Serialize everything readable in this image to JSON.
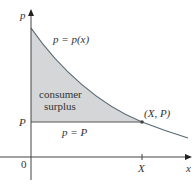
{
  "diagram": {
    "title": "Consumer surplus",
    "axes": {
      "y_label": "p",
      "x_label": "x",
      "origin_label": "0"
    },
    "curve_label": "p = p(x)",
    "region_label_line1": "consumer",
    "region_label_line2": "surplus",
    "price_line_label": "p = P",
    "price_tick_label": "P",
    "quantity_tick_label": "X",
    "point_label": "(X, P)",
    "colors": {
      "region_fill": "#d4d6d8",
      "curve": "#5a6a74",
      "axis": "#444444",
      "text": "#333333"
    }
  }
}
